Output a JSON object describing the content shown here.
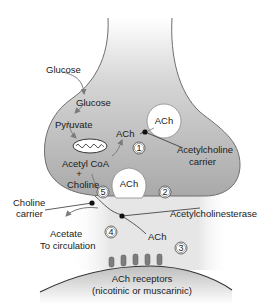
{
  "diagram": {
    "type": "cholinergic-synapse",
    "colors": {
      "terminal_fill": "#b8b8b8",
      "terminal_edge": "#6e6e6e",
      "cleft_fill": "#e4e4e4",
      "postsynaptic_fill": "#c9c9c9",
      "vesicle_fill": "#ffffff",
      "carrier_dot": "#111111",
      "arrow": "#7a7a7a"
    },
    "labels": {
      "glucose_outside": "Glucose",
      "glucose_inside": "Glucose",
      "pyruvate": "Pyruvate",
      "acetyl_coa": "Acetyl CoA",
      "plus": "+",
      "choline_inside": "Choline",
      "ach_synth": "ACh",
      "ach_vesicle_1": "ACh",
      "ach_vesicle_2": "ACh",
      "ach_carrier_line1": "Acetylcholine",
      "ach_carrier_line2": "carrier",
      "choline_carrier_line1": "Choline",
      "choline_carrier_line2": "carrier",
      "acetylcholinesterase": "Acetylcholinesterase",
      "acetate_line1": "Acetate",
      "acetate_line2": "To circulation",
      "ach_cleft": "ACh",
      "receptors_line1": "ACh receptors",
      "receptors_line2": "(nicotinic or muscarinic)"
    },
    "steps": [
      "1",
      "2",
      "3",
      "4",
      "5"
    ]
  }
}
